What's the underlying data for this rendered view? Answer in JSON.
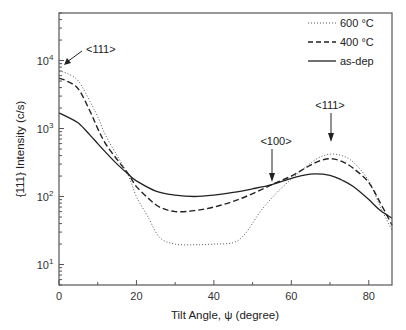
{
  "chart_data": {
    "type": "line",
    "title": "",
    "xlabel": "Tilt Angle, ψ (degree)",
    "ylabel": "{111} Intensity (c/s)",
    "xlim": [
      0,
      86
    ],
    "ylim": [
      5,
      50000
    ],
    "yscale": "log",
    "xticks": [
      0,
      20,
      40,
      60,
      80
    ],
    "xtick_labels": [
      "0",
      "20",
      "40",
      "60",
      "80"
    ],
    "yticks": [
      10,
      100,
      1000,
      10000
    ],
    "ytick_labels": [
      {
        "base": "10",
        "exp": "1"
      },
      {
        "base": "10",
        "exp": "2"
      },
      {
        "base": "10",
        "exp": "3"
      },
      {
        "base": "10",
        "exp": "4"
      }
    ],
    "grid": false,
    "legend_position": "upper right",
    "series": [
      {
        "name": "600 °C",
        "style": "dotted",
        "x": [
          0,
          2,
          5,
          8,
          10,
          12,
          15,
          18,
          20,
          23,
          26,
          30,
          35,
          40,
          45,
          48,
          52,
          56,
          60,
          64,
          67,
          70,
          73,
          76,
          80,
          83,
          86
        ],
        "y": [
          7000,
          6500,
          5000,
          2500,
          1500,
          800,
          400,
          200,
          100,
          50,
          25,
          20,
          19.5,
          20,
          21,
          28,
          60,
          110,
          180,
          280,
          370,
          420,
          400,
          320,
          170,
          70,
          32
        ]
      },
      {
        "name": "400 °C",
        "style": "dashed",
        "x": [
          0,
          2,
          5,
          8,
          10,
          12,
          15,
          18,
          20,
          23,
          26,
          30,
          35,
          40,
          45,
          50,
          55,
          60,
          64,
          67,
          70,
          73,
          76,
          80,
          83,
          86
        ],
        "y": [
          5500,
          5000,
          3800,
          1800,
          1000,
          600,
          350,
          210,
          140,
          95,
          70,
          60,
          62,
          70,
          85,
          110,
          150,
          200,
          270,
          330,
          360,
          330,
          260,
          160,
          80,
          38
        ]
      },
      {
        "name": "as-dep",
        "style": "solid",
        "x": [
          0,
          2,
          5,
          8,
          10,
          12,
          15,
          18,
          20,
          25,
          30,
          35,
          40,
          45,
          50,
          55,
          60,
          63,
          66,
          70,
          73,
          76,
          80,
          83,
          86
        ],
        "y": [
          1700,
          1500,
          1200,
          800,
          600,
          450,
          300,
          210,
          170,
          120,
          105,
          100,
          105,
          115,
          130,
          150,
          185,
          205,
          215,
          205,
          175,
          140,
          90,
          62,
          48
        ]
      }
    ],
    "annotations": [
      {
        "text": "<111>",
        "x": 2,
        "y": 9000,
        "arrow_to": {
          "x": 1,
          "y": 7500
        }
      },
      {
        "text": "<100>",
        "x": 55,
        "y": 600,
        "arrow_to": {
          "x": 55,
          "y": 180
        }
      },
      {
        "text": "<111>",
        "x": 70,
        "y": 1200,
        "arrow_to": {
          "x": 70,
          "y": 480
        }
      }
    ]
  },
  "legend": {
    "items": [
      {
        "label": "600 °C",
        "style": "dotted"
      },
      {
        "label": "400 °C",
        "style": "dashed"
      },
      {
        "label": "as-dep",
        "style": "solid"
      }
    ]
  },
  "axes": {
    "xlabel": "Tilt Angle, ψ (degree)",
    "ylabel": "{111} Intensity (c/s)"
  },
  "annotations": {
    "a1": "<111>",
    "a2": "<100>",
    "a3": "<111>"
  }
}
